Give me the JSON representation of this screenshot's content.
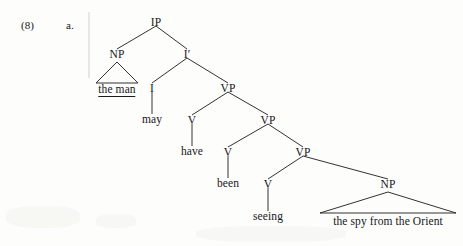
{
  "figure": {
    "example_number": "(8)",
    "item_letter": "a.",
    "sentence": "the man may have been seeing the spy from the Orient",
    "ink_color": "#1b1b1f",
    "background_color": "#fdfdfc"
  },
  "tree": {
    "nodes": [
      {
        "id": "IP",
        "label": "IP",
        "kind": "category",
        "x": 156,
        "y": 23
      },
      {
        "id": "NP1",
        "label": "NP",
        "kind": "category",
        "x": 117,
        "y": 55
      },
      {
        "id": "Ibar",
        "label": "I′",
        "kind": "category",
        "x": 187,
        "y": 55
      },
      {
        "id": "theman",
        "label": "the man",
        "kind": "terminal",
        "x": 117,
        "y": 90
      },
      {
        "id": "I",
        "label": "I",
        "kind": "category",
        "x": 152,
        "y": 89
      },
      {
        "id": "may",
        "label": "may",
        "kind": "terminal",
        "x": 152,
        "y": 120
      },
      {
        "id": "VP1",
        "label": "VP",
        "kind": "category",
        "x": 228,
        "y": 89
      },
      {
        "id": "V1",
        "label": "V",
        "kind": "category",
        "x": 192,
        "y": 121
      },
      {
        "id": "have",
        "label": "have",
        "kind": "terminal",
        "x": 192,
        "y": 152
      },
      {
        "id": "VP2",
        "label": "VP",
        "kind": "category",
        "x": 268,
        "y": 121
      },
      {
        "id": "V2",
        "label": "V",
        "kind": "category",
        "x": 228,
        "y": 153
      },
      {
        "id": "been",
        "label": "been",
        "kind": "terminal",
        "x": 228,
        "y": 184
      },
      {
        "id": "VP3",
        "label": "VP",
        "kind": "category",
        "x": 303,
        "y": 153
      },
      {
        "id": "V3",
        "label": "V",
        "kind": "category",
        "x": 268,
        "y": 185
      },
      {
        "id": "seeing",
        "label": "seeing",
        "kind": "terminal",
        "x": 268,
        "y": 217
      },
      {
        "id": "NP2",
        "label": "NP",
        "kind": "category",
        "x": 388,
        "y": 185
      },
      {
        "id": "spy",
        "label": "the spy from the Orient",
        "kind": "terminal",
        "x": 388,
        "y": 222
      }
    ],
    "edges": [
      {
        "from": "IP",
        "to": "NP1",
        "style": "branch"
      },
      {
        "from": "IP",
        "to": "Ibar",
        "style": "branch"
      },
      {
        "from": "Ibar",
        "to": "I",
        "style": "branch"
      },
      {
        "from": "Ibar",
        "to": "VP1",
        "style": "branch"
      },
      {
        "from": "I",
        "to": "may",
        "style": "stem"
      },
      {
        "from": "VP1",
        "to": "V1",
        "style": "branch"
      },
      {
        "from": "VP1",
        "to": "VP2",
        "style": "branch"
      },
      {
        "from": "V1",
        "to": "have",
        "style": "stem"
      },
      {
        "from": "VP2",
        "to": "V2",
        "style": "branch"
      },
      {
        "from": "VP2",
        "to": "VP3",
        "style": "branch"
      },
      {
        "from": "V2",
        "to": "been",
        "style": "stem"
      },
      {
        "from": "VP3",
        "to": "V3",
        "style": "branch"
      },
      {
        "from": "VP3",
        "to": "NP2",
        "style": "branch"
      },
      {
        "from": "V3",
        "to": "seeing",
        "style": "stem"
      }
    ],
    "triangles": [
      {
        "parent": "NP1",
        "apex_x": 117,
        "apex_y": 62,
        "left_x": 96,
        "right_x": 138,
        "base_y": 83
      },
      {
        "parent": "NP2",
        "apex_x": 388,
        "apex_y": 192,
        "left_x": 320,
        "right_x": 456,
        "base_y": 213
      }
    ]
  }
}
